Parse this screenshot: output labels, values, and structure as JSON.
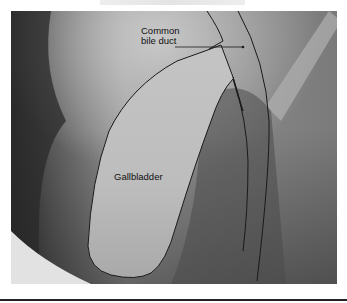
{
  "figure": {
    "labels": {
      "common_bile_duct_line1": "Common",
      "common_bile_duct_line2": "bile duct",
      "gallbladder": "Gallbladder"
    },
    "colors": {
      "background": "#ffffff",
      "outline": "#1a1a1a",
      "rule": "#222222"
    }
  }
}
